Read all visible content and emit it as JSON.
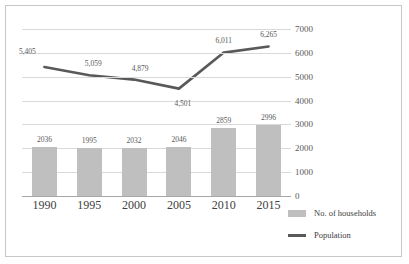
{
  "chart_data": {
    "type": "bar",
    "title": "",
    "subtitle": "",
    "xlabel": "",
    "ylabel": "",
    "categories": [
      "1990",
      "1995",
      "2000",
      "2005",
      "2010",
      "2015"
    ],
    "ylim": [
      0,
      7000
    ],
    "ytick_labels": [
      "0",
      "1000",
      "2000",
      "3000",
      "4000",
      "5000",
      "6000",
      "7000"
    ],
    "ytick_values": [
      0,
      1000,
      2000,
      3000,
      4000,
      5000,
      6000,
      7000
    ],
    "grid": true,
    "legend_position": "bottom-right",
    "series": [
      {
        "name": "No. of households",
        "type": "bar",
        "color": "#bfbfbf",
        "values": [
          2036,
          1995,
          2032,
          2046,
          2859,
          2996
        ],
        "labels": [
          "2036",
          "1995",
          "2032",
          "2046",
          "2859",
          "2996"
        ]
      },
      {
        "name": "Population",
        "type": "line",
        "color": "#595959",
        "values": [
          5405,
          5059,
          4879,
          4501,
          6011,
          6265
        ],
        "labels": [
          "5,405",
          "5,059",
          "4,879",
          "4,501",
          "6,011",
          "6,265"
        ]
      }
    ]
  },
  "legend": {
    "items": [
      {
        "label": "No. of households"
      },
      {
        "label": "Population"
      }
    ]
  }
}
